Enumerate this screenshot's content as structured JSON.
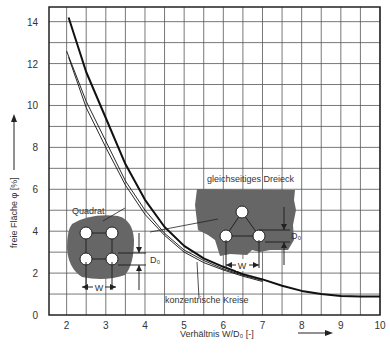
{
  "chart_data": {
    "type": "line",
    "title": "",
    "xlabel": "Verhältnis  W/D₀  [-]",
    "ylabel": "freie Fläche φ [%]",
    "xlim": [
      1.55,
      10
    ],
    "ylim": [
      0,
      14.7
    ],
    "xticks": [
      2,
      3,
      4,
      5,
      6,
      7,
      8,
      9,
      10
    ],
    "yticks": [
      0,
      2,
      4,
      6,
      8,
      10,
      12,
      14
    ],
    "grid": true,
    "series": [
      {
        "name": "gleichseitiges Dreieck",
        "style": "thick",
        "x": [
          2.05,
          2.5,
          3,
          3.5,
          4,
          4.5,
          5,
          5.5,
          6,
          6.5,
          7,
          7.5,
          8,
          8.5,
          9,
          9.5,
          10
        ],
        "y": [
          14.2,
          11.6,
          9.4,
          7.2,
          5.5,
          4.2,
          3.3,
          2.7,
          2.3,
          1.95,
          1.7,
          1.4,
          1.15,
          1.0,
          0.9,
          0.88,
          0.88
        ]
      },
      {
        "name": "Quadrat",
        "style": "thin",
        "x": [
          2.0,
          2.5,
          3,
          3.5,
          4,
          4.5,
          5,
          5.5,
          6,
          6.5,
          7
        ],
        "y": [
          12.6,
          10.2,
          8.3,
          6.4,
          5.0,
          3.9,
          3.1,
          2.6,
          2.2,
          1.9,
          1.65
        ]
      },
      {
        "name": "konzentrische Kreise",
        "style": "thin",
        "x": [
          2.05,
          2.5,
          3,
          3.5,
          4,
          4.5,
          5,
          5.5,
          6,
          6.5,
          7
        ],
        "y": [
          12.3,
          9.9,
          8.0,
          6.2,
          4.8,
          3.8,
          3.0,
          2.5,
          2.15,
          1.85,
          1.6
        ]
      }
    ],
    "annotations": [
      "Quadrat",
      "gleichseitiges Dreieck",
      "konzentrische Kreise",
      "W",
      "D₀",
      "W",
      "D₀"
    ]
  },
  "labels": {
    "x_axis": "Verhältnis  W/D₀  [-]",
    "y_axis": "freie Fläche φ [%]",
    "quadrat": "Quadrat",
    "dreieck": "gleichseitiges Dreieck",
    "kreise": "konzentrische Kreise",
    "w": "W",
    "d0": "D₀"
  }
}
